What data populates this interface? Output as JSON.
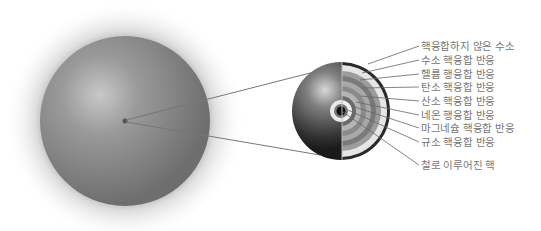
{
  "diagram": {
    "title": "",
    "star": {
      "description": "massive star exterior"
    },
    "cross_section": {
      "description": "onion-layer shell structure of a massive star core"
    },
    "labels": [
      {
        "text": "핵융합하지 않은 수소",
        "y": 40
      },
      {
        "text": "수소 핵융합 반응",
        "y": 54
      },
      {
        "text": "헬륨 행융합 반응",
        "y": 68
      },
      {
        "text": "탄소 핵융합 반응",
        "y": 81
      },
      {
        "text": "산소 핵융합 반응",
        "y": 95
      },
      {
        "text": "네온 행융합 반응",
        "y": 109
      },
      {
        "text": "마그네슘 핵융합 반응",
        "y": 122
      },
      {
        "text": "규소 핵융합 반응",
        "y": 136
      },
      {
        "text": "철로 이루어진 핵",
        "y": 159
      }
    ]
  }
}
